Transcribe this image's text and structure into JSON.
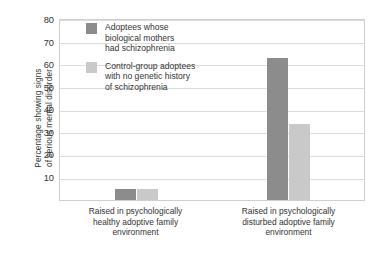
{
  "chart_data": {
    "type": "bar",
    "title": "",
    "xlabel": "",
    "ylabel": "Percentage showing signs of serious mental disorder",
    "ylabel_lines": [
      "Percentage showing signs",
      "of serious mental disorder"
    ],
    "ylim": [
      0,
      80
    ],
    "yticks": [
      10,
      20,
      30,
      40,
      50,
      60,
      70,
      80
    ],
    "grid": true,
    "legend_position": "inside-top-left",
    "categories": [
      "Raised in psychologically healthy adoptive family environment",
      "Raised in psychologically disturbed adoptive family environment"
    ],
    "category_lines": [
      [
        "Raised in psychologically",
        "healthy adoptive family",
        "environment"
      ],
      [
        "Raised in psychologically",
        "disturbed adoptive family",
        "environment"
      ]
    ],
    "series": [
      {
        "name": "Adoptees whose biological mothers had schizophrenia",
        "name_lines": [
          "Adoptees whose",
          "biological mothers",
          "had schizophrenia"
        ],
        "color": "#8c8c8c",
        "values": [
          5,
          63
        ]
      },
      {
        "name": "Control-group adoptees with no genetic history of schizophrenia",
        "name_lines": [
          "Control-group adoptees",
          "with no genetic history",
          "of schizophrenia"
        ],
        "color": "#c9c9c9",
        "values": [
          5,
          34
        ]
      }
    ]
  },
  "colors": {
    "series_0": "#8c8c8c",
    "series_1": "#c9c9c9",
    "gridline": "#dcdcdc",
    "frame": "#cfcfcf",
    "text": "#333333",
    "background": "#ffffff"
  },
  "yticks": {
    "t0": "80",
    "t1": "70",
    "t2": "60",
    "t3": "50",
    "t4": "40",
    "t5": "30",
    "t6": "20",
    "t7": "10"
  },
  "ylabel": {
    "line0": "Percentage showing signs",
    "line1": "of serious mental disorder"
  },
  "legend": {
    "items": [
      {
        "line0": "Adoptees whose",
        "line1": "biological mothers",
        "line2": "had schizophrenia"
      },
      {
        "line0": "Control-group adoptees",
        "line1": "with no genetic history",
        "line2": "of schizophrenia"
      }
    ]
  },
  "xlabels": {
    "cat0": {
      "line0": "Raised in psychologically",
      "line1": "healthy adoptive family",
      "line2": "environment"
    },
    "cat1": {
      "line0": "Raised in psychologically",
      "line1": "disturbed adoptive family",
      "line2": "environment"
    }
  }
}
